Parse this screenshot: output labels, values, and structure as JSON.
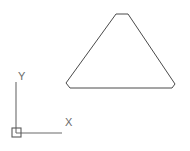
{
  "drawing": {
    "background_color": "#ffffff",
    "line_color": "#4a4a4a",
    "ucs_color": "#6b6b6b",
    "canvas": {
      "width": 190,
      "height": 151
    }
  },
  "ucs_icon": {
    "name": "ucs-coordinate-icon",
    "origin": {
      "x": 16,
      "y": 133
    },
    "origin_box": {
      "x": 12,
      "y": 128,
      "size": 9
    },
    "y_axis": {
      "x1": 16,
      "y1": 133,
      "x2": 16,
      "y2": 82
    },
    "x_axis": {
      "x1": 16,
      "y1": 133,
      "x2": 62,
      "y2": 133
    },
    "x_label": {
      "text": "X",
      "x": 67,
      "y": 126
    },
    "y_label": {
      "text": "Y",
      "x": 21,
      "y": 80
    }
  },
  "shape": {
    "name": "chamfered-triangle",
    "description": "Triangle with chamfered corners",
    "points": "116,14 128,14 175,84 172,88 70,88 66,83",
    "vertices": [
      {
        "x": 116,
        "y": 14
      },
      {
        "x": 128,
        "y": 14
      },
      {
        "x": 175,
        "y": 84
      },
      {
        "x": 172,
        "y": 88
      },
      {
        "x": 70,
        "y": 88
      },
      {
        "x": 66,
        "y": 83
      }
    ]
  }
}
